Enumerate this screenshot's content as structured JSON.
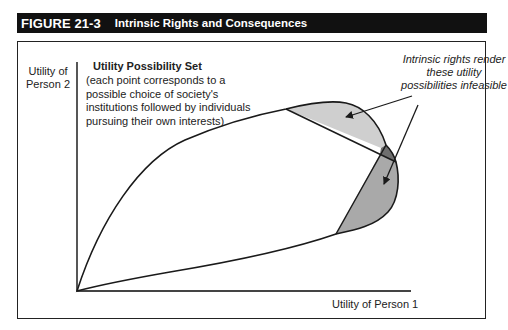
{
  "figure": {
    "number": "FIGURE 21-3",
    "title": "Intrinsic Rights and Consequences"
  },
  "axes": {
    "y_label": "Utility of Person 2",
    "x_label": "Utility of Person 1"
  },
  "utility_set": {
    "title": "Utility Possibility Set",
    "description": "(each point corresponds to a possible choice of society's institutions followed by individuals pursuing their own interests)"
  },
  "annotation": {
    "text": "Intrinsic rights render these utility possibilities infeasible"
  },
  "colors": {
    "title_bar": "#111111",
    "region_light": "#cfcfcf",
    "region_medium": "#a9a9a9",
    "region_dark": "#6e6e6e",
    "stroke": "#1a1a1a"
  }
}
